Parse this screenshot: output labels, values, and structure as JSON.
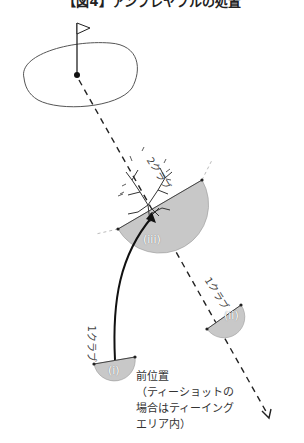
{
  "title": "【図4】アンプレヤブルの処置",
  "colors": {
    "line": "#222222",
    "relief_area_fill": "#c8c8c8",
    "green_outline": "#555555"
  },
  "labels": {
    "two_club": "2クラブ",
    "one_club_right": "1クラブ",
    "one_club_left": "1クラブ",
    "option_i": "(i)",
    "option_ii": "(ii)",
    "option_iii": "(iii)"
  },
  "note": {
    "line1": "前位置",
    "line2": "（ティーショットの",
    "line3": "場合はティーイング",
    "line4": "エリア内）"
  },
  "icons": {
    "flag": "flag-icon",
    "tree": "tree-icon",
    "hole": "hole-icon"
  }
}
